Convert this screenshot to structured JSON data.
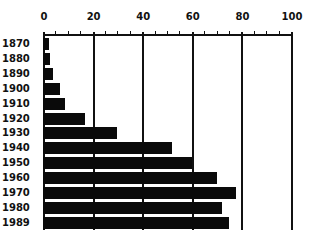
{
  "chart_data": {
    "type": "bar",
    "orientation": "horizontal",
    "title": "",
    "xlabel": "",
    "ylabel": "",
    "categories": [
      "1870",
      "1880",
      "1890",
      "1900",
      "1910",
      "1920",
      "1930",
      "1940",
      "1950",
      "1960",
      "1970",
      "1980",
      "1989"
    ],
    "values": [
      2.5,
      3,
      4,
      7,
      9,
      17,
      30,
      52,
      60,
      70,
      78,
      72,
      75
    ],
    "x_ticks": [
      "0",
      "20",
      "40",
      "60",
      "80",
      "100"
    ],
    "xlim": [
      0,
      100
    ],
    "axis_position": "top",
    "grid": true,
    "legend": null,
    "bar_color": "#0a0a0a"
  }
}
